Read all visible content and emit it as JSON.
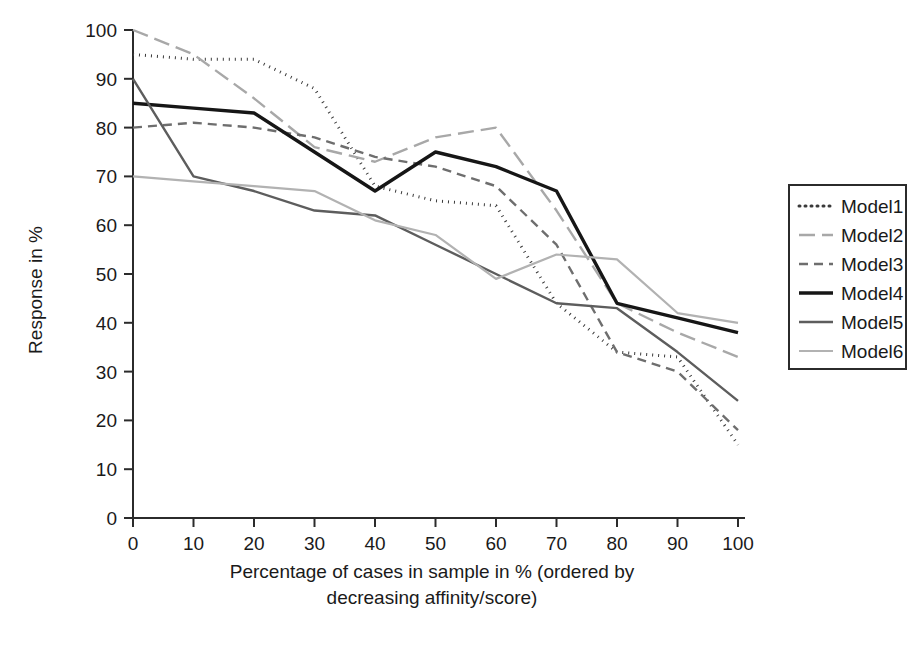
{
  "chart_data": {
    "type": "line",
    "title": "",
    "xlabel": "Percentage of cases in sample in % (ordered by decreasing affinity/score)",
    "xlabel_line1": "Percentage of cases in sample in % (ordered by",
    "xlabel_line2": "decreasing affinity/score)",
    "ylabel": "Response in %",
    "x": [
      0,
      10,
      20,
      30,
      40,
      50,
      60,
      70,
      80,
      90,
      100
    ],
    "xlim": [
      0,
      100
    ],
    "ylim": [
      0,
      100
    ],
    "xticks": [
      "0",
      "10",
      "20",
      "30",
      "40",
      "50",
      "60",
      "70",
      "80",
      "90",
      "100"
    ],
    "yticks": [
      "0",
      "10",
      "20",
      "30",
      "40",
      "50",
      "60",
      "70",
      "80",
      "90",
      "100"
    ],
    "grid": false,
    "legend_position": "right",
    "series": [
      {
        "name": "Model1",
        "style": "dotted",
        "color": "#3a3a3a",
        "width": 3,
        "dash": "1,5",
        "values": [
          95,
          94,
          94,
          88,
          68,
          65,
          64,
          44,
          34,
          33,
          15
        ]
      },
      {
        "name": "Model2",
        "style": "long-dash",
        "color": "#a8a8a8",
        "width": 2.4,
        "dash": "16,7",
        "values": [
          100,
          95,
          86,
          76,
          73,
          78,
          80,
          63,
          44,
          38,
          33
        ]
      },
      {
        "name": "Model3",
        "style": "dashed",
        "color": "#6e6e6e",
        "width": 2.4,
        "dash": "9,6",
        "values": [
          80,
          81,
          80,
          78,
          74,
          72,
          68,
          56,
          34,
          30,
          18
        ]
      },
      {
        "name": "Model4",
        "style": "solid-thick",
        "color": "#161616",
        "width": 3.4,
        "dash": "none",
        "values": [
          85,
          84,
          83,
          75,
          67,
          75,
          72,
          67,
          44,
          41,
          38
        ]
      },
      {
        "name": "Model5",
        "style": "solid",
        "color": "#5d5d5d",
        "width": 2.4,
        "dash": "none",
        "values": [
          90,
          70,
          67,
          63,
          62,
          56,
          50,
          44,
          43,
          34,
          24
        ]
      },
      {
        "name": "Model6",
        "style": "solid-thin",
        "color": "#b2b2b2",
        "width": 2.2,
        "dash": "none",
        "values": [
          70,
          69,
          68,
          67,
          61,
          58,
          49,
          54,
          53,
          42,
          40
        ]
      }
    ]
  },
  "legend": {
    "entries": [
      {
        "label": "Model1"
      },
      {
        "label": "Model2"
      },
      {
        "label": "Model3"
      },
      {
        "label": "Model4"
      },
      {
        "label": "Model5"
      },
      {
        "label": "Model6"
      }
    ]
  }
}
